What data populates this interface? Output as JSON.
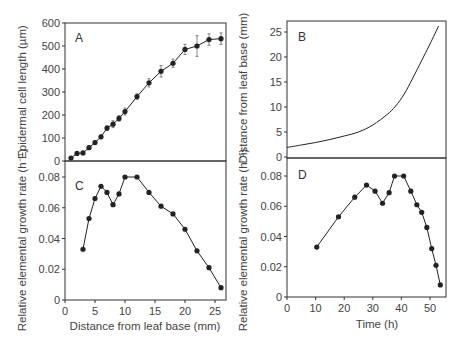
{
  "chart_data": [
    {
      "panel": "A",
      "type": "line",
      "title": "",
      "xlabel": "Distance from leaf base (mm)",
      "ylabel": "Epidermal cell length (µm)",
      "xlim": [
        0,
        27
      ],
      "ylim": [
        0,
        600
      ],
      "yticks": [
        0,
        100,
        200,
        300,
        400,
        500,
        600
      ],
      "error_bars": true,
      "grid": false,
      "x": [
        1,
        2,
        3,
        4,
        5,
        6,
        7,
        8,
        9,
        10,
        12,
        14,
        16,
        18,
        20,
        22,
        24,
        26
      ],
      "y": [
        13,
        33,
        35,
        58,
        80,
        105,
        143,
        160,
        185,
        215,
        280,
        340,
        390,
        425,
        485,
        500,
        528,
        532
      ],
      "err": [
        3,
        5,
        5,
        6,
        6,
        8,
        10,
        15,
        12,
        15,
        12,
        18,
        25,
        18,
        22,
        45,
        25,
        25
      ]
    },
    {
      "panel": "B",
      "type": "line",
      "title": "",
      "xlabel": "Time (h)",
      "ylabel": "Distance from leaf base (mm)",
      "xlim": [
        0,
        56
      ],
      "ylim": [
        0,
        27
      ],
      "yticks": [
        0,
        5,
        10,
        15,
        20,
        25
      ],
      "grid": false,
      "x": [
        0,
        5,
        10,
        15,
        20,
        25,
        30,
        35,
        38,
        41,
        44,
        47,
        50,
        53
      ],
      "y": [
        1.9,
        2.4,
        2.9,
        3.5,
        4.2,
        5.0,
        6.4,
        8.5,
        10.2,
        12.6,
        15.8,
        19.2,
        22.6,
        26.2
      ]
    },
    {
      "panel": "C",
      "type": "line",
      "title": "",
      "xlabel": "Distance from leaf base (mm)",
      "ylabel": "Relative elemental growth rate (h⁻¹)",
      "xlim": [
        0,
        27
      ],
      "ylim": [
        0,
        0.085
      ],
      "xticks": [
        0,
        5,
        10,
        15,
        20,
        25
      ],
      "yticks": [
        0,
        0.02,
        0.04,
        0.06,
        0.08
      ],
      "grid": false,
      "x": [
        3,
        4,
        5,
        6,
        7,
        8,
        9,
        10,
        12,
        14,
        16,
        18,
        20,
        22,
        24,
        26
      ],
      "y": [
        0.033,
        0.053,
        0.066,
        0.074,
        0.07,
        0.062,
        0.069,
        0.08,
        0.08,
        0.07,
        0.061,
        0.056,
        0.046,
        0.032,
        0.021,
        0.008
      ]
    },
    {
      "panel": "D",
      "type": "line",
      "title": "",
      "xlabel": "Time (h)",
      "ylabel": "Relative elemental growth rate (h⁻¹)",
      "xlim": [
        0,
        56
      ],
      "ylim": [
        0,
        0.085
      ],
      "xticks": [
        0,
        10,
        20,
        30,
        40,
        50
      ],
      "yticks": [
        0,
        0.02,
        0.04,
        0.06,
        0.08
      ],
      "grid": false,
      "x": [
        10.4,
        18.0,
        23.7,
        27.8,
        30.8,
        33.4,
        35.7,
        37.6,
        40.8,
        43.3,
        45.4,
        47.1,
        48.9,
        50.6,
        52.1,
        53.6
      ],
      "y": [
        0.033,
        0.053,
        0.066,
        0.074,
        0.07,
        0.062,
        0.069,
        0.08,
        0.08,
        0.07,
        0.061,
        0.056,
        0.046,
        0.032,
        0.021,
        0.008
      ]
    }
  ],
  "labels": {
    "panelA": "A",
    "panelB": "B",
    "panelC": "C",
    "panelD": "D",
    "ylabelA": "Epidermal cell length (µm)",
    "ylabelB": "Distance from leaf base (mm)",
    "ylabelC": "Relative elemental growth rate (h⁻¹)",
    "ylabelD": "Relative elemental growth rate (h⁻¹)",
    "xlabelC": "Distance from leaf base (mm)",
    "xlabelD": "Time (h)"
  },
  "colors": {
    "line": "#222222",
    "axis": "#333333",
    "text": "#444444"
  }
}
